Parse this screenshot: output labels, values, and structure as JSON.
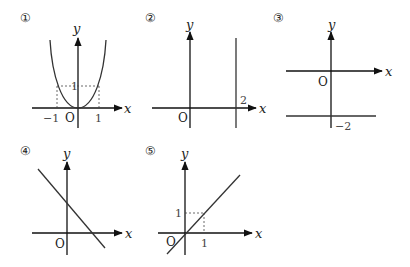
{
  "graphs": [
    {
      "number": "①",
      "x_label": "x",
      "y_label": "y",
      "origin": "O",
      "ticks": {
        "x_neg": "−1",
        "x_pos": "1",
        "y": "1"
      },
      "description": "parabola-like curve through origin with points (−1,1) and (1,1) marked by dashed lines"
    },
    {
      "number": "②",
      "x_label": "x",
      "y_label": "y",
      "origin": "O",
      "ticks": {
        "x": "2"
      },
      "description": "vertical line x = 2"
    },
    {
      "number": "③",
      "x_label": "x",
      "y_label": "y",
      "origin": "O",
      "ticks": {
        "y": "−2"
      },
      "description": "horizontal line y = −2"
    },
    {
      "number": "④",
      "x_label": "x",
      "y_label": "y",
      "origin": "O",
      "description": "line with negative slope and positive y-intercept"
    },
    {
      "number": "⑤",
      "x_label": "x",
      "y_label": "y",
      "origin": "O",
      "ticks": {
        "x": "1",
        "y": "1"
      },
      "description": "line y = x through origin with point (1,1) marked by dashed lines"
    }
  ]
}
